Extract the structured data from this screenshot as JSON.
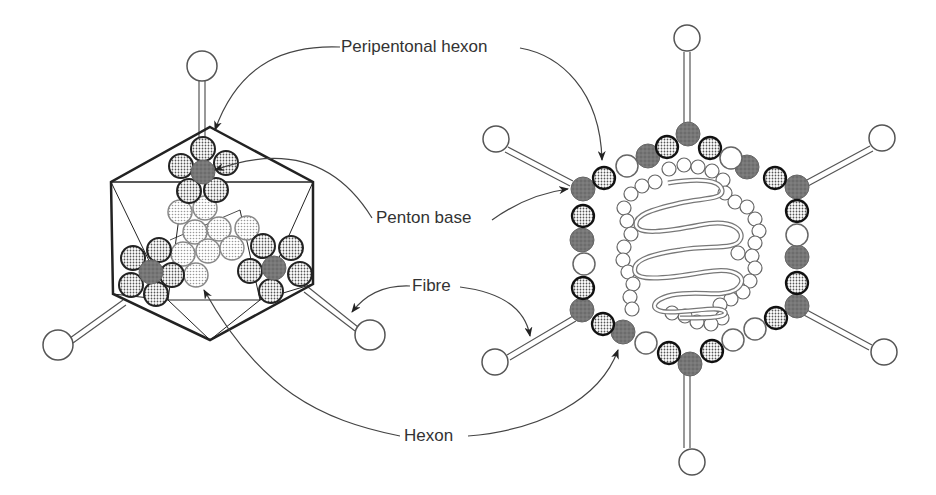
{
  "labels": {
    "peripentonal_hexon": "Peripentonal hexon",
    "penton_base": "Penton base",
    "fibre": "Fibre",
    "hexon": "Hexon"
  },
  "colors": {
    "line": "#222222",
    "leader": "#444444",
    "penton": "#6e6e6e",
    "peripentonal_fill": "#bdbdbd",
    "hexon_fill": "#d6d6d6",
    "hexon_stroke": "#8a8a8a",
    "empty_fill": "#ffffff"
  },
  "left_virion": {
    "view": "icosahedral external view",
    "vertices": {
      "top": [
        210,
        127
      ],
      "ul": [
        111,
        182
      ],
      "ur": [
        313,
        182
      ],
      "ll": [
        113,
        294
      ],
      "lr": [
        313,
        284
      ],
      "bottom": [
        210,
        340
      ]
    },
    "fibre_balls": [
      [
        202,
        66
      ],
      [
        58,
        345
      ],
      [
        370,
        335
      ]
    ]
  },
  "right_virion": {
    "view": "cross-section",
    "center": [
      690,
      245
    ],
    "fibre_balls": [
      [
        687,
        38
      ],
      [
        496,
        139
      ],
      [
        882,
        138
      ],
      [
        495,
        362
      ],
      [
        884,
        352
      ],
      [
        692,
        462
      ]
    ]
  }
}
